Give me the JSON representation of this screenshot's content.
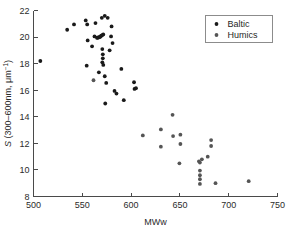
{
  "chart_data": {
    "type": "scatter",
    "title": "",
    "xlabel": "MWw",
    "ylabel": "S (300–600nm, μm⁻¹)",
    "ylabel_italic_prefix": "S",
    "ylabel_rest": " (300–600nm, μm",
    "ylabel_exponent": "−1",
    "ylabel_close": ")",
    "xlim": [
      500,
      750
    ],
    "ylim": [
      8,
      22
    ],
    "xticks": [
      500,
      550,
      600,
      650,
      700,
      750
    ],
    "yticks": [
      8,
      10,
      12,
      14,
      16,
      18,
      20,
      22
    ],
    "grid": false,
    "legend_position": "top-right",
    "series": [
      {
        "name": "Baltic",
        "color": "#1a1a1a",
        "marker": "circle",
        "points": [
          [
            507.0,
            18.2
          ],
          [
            534.5,
            20.55
          ],
          [
            541.5,
            20.95
          ],
          [
            553.5,
            21.25
          ],
          [
            555.0,
            20.95
          ],
          [
            555.5,
            19.75
          ],
          [
            554.5,
            17.85
          ],
          [
            560.0,
            19.3
          ],
          [
            562.5,
            20.05
          ],
          [
            563.5,
            21.05
          ],
          [
            565.0,
            19.95
          ],
          [
            566.0,
            19.95
          ],
          [
            567.0,
            20.0
          ],
          [
            568.0,
            20.0
          ],
          [
            568.5,
            20.05
          ],
          [
            569.5,
            20.1
          ],
          [
            570.5,
            20.15
          ],
          [
            571.5,
            20.2
          ],
          [
            570.0,
            21.45
          ],
          [
            573.0,
            21.6
          ],
          [
            576.0,
            21.45
          ],
          [
            570.5,
            19.1
          ],
          [
            571.0,
            18.7
          ],
          [
            571.0,
            18.4
          ],
          [
            570.5,
            18.1
          ],
          [
            571.5,
            17.9
          ],
          [
            567.0,
            17.35
          ],
          [
            573.0,
            17.05
          ],
          [
            574.5,
            16.55
          ],
          [
            573.5,
            15.0
          ],
          [
            578.0,
            19.0
          ],
          [
            579.5,
            20.05
          ],
          [
            580.0,
            20.8
          ],
          [
            581.0,
            19.55
          ],
          [
            583.0,
            15.95
          ],
          [
            585.0,
            15.75
          ],
          [
            590.0,
            17.6
          ],
          [
            592.5,
            15.25
          ],
          [
            603.0,
            16.6
          ],
          [
            603.5,
            16.1
          ],
          [
            605.0,
            16.15
          ]
        ]
      },
      {
        "name": "Humics",
        "color": "#555555",
        "marker": "circle",
        "points": [
          [
            561.5,
            16.75
          ],
          [
            612.0,
            12.6
          ],
          [
            630.5,
            13.05
          ],
          [
            630.5,
            11.75
          ],
          [
            642.5,
            14.15
          ],
          [
            643.0,
            12.55
          ],
          [
            650.5,
            12.65
          ],
          [
            650.5,
            11.95
          ],
          [
            649.5,
            10.5
          ],
          [
            669.5,
            10.65
          ],
          [
            670.5,
            10.55
          ],
          [
            672.5,
            10.8
          ],
          [
            670.5,
            9.95
          ],
          [
            670.5,
            9.6
          ],
          [
            670.5,
            9.3
          ],
          [
            670.5,
            8.95
          ],
          [
            678.5,
            11.0
          ],
          [
            682.0,
            12.25
          ],
          [
            682.0,
            11.8
          ],
          [
            686.5,
            9.0
          ],
          [
            720.5,
            9.15
          ]
        ]
      }
    ],
    "legend": [
      {
        "label": "Baltic",
        "color": "#1a1a1a"
      },
      {
        "label": "Humics",
        "color": "#555555"
      }
    ]
  },
  "caption": {
    "partial_text": ""
  }
}
